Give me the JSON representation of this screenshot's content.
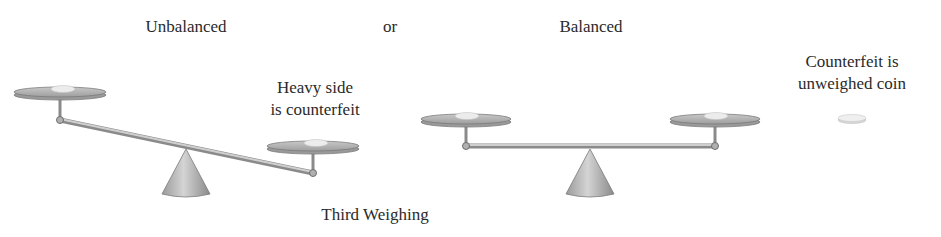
{
  "labels": {
    "unbalanced": "Unbalanced",
    "or": "or",
    "balanced": "Balanced",
    "heavy_side_line1": "Heavy side",
    "heavy_side_line2": "is counterfeit",
    "counterfeit_line1": "Counterfeit is",
    "counterfeit_line2": "unweighed coin",
    "caption": "Third Weighing"
  },
  "colors": {
    "metal": "#a8a8a8",
    "metal_dark": "#7a7a7a",
    "coin": "#e8e8e8",
    "text": "#2a2a2a"
  }
}
